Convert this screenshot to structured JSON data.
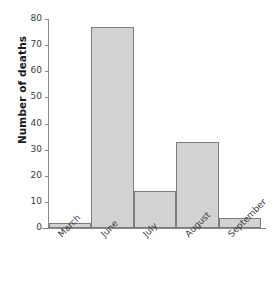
{
  "chart_data": {
    "type": "bar",
    "title": "",
    "xlabel": "",
    "ylabel": "Number of deaths",
    "categories": [
      "March",
      "June",
      "July",
      "August",
      "September"
    ],
    "values": [
      2,
      77,
      14,
      33,
      4
    ],
    "ylim": [
      0,
      80
    ],
    "yticks": [
      0,
      10,
      20,
      30,
      40,
      50,
      60,
      70,
      80
    ],
    "ytick_labels": [
      "0",
      "10",
      "20",
      "30",
      "40",
      "50",
      "60",
      "70",
      "80"
    ],
    "grid": false,
    "legend": "none",
    "bar_fill_color": "#d2d2d2",
    "bar_border_color": "#7d7d7d",
    "axis_color": "#8a8a8a",
    "text_color": "#3c3c3c",
    "xlabel_rotation_deg": -45
  }
}
